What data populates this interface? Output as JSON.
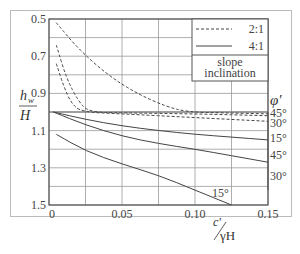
{
  "chart_data": {
    "type": "line",
    "title": "",
    "xlabel": "c'/γH",
    "ylabel": "h_w/H",
    "xlim": [
      0,
      0.15
    ],
    "ylim": [
      1.5,
      0.5
    ],
    "y_inverted": true,
    "grid": true,
    "x_ticks": [
      "0",
      "0.05",
      "0.10",
      "0.15"
    ],
    "y_ticks": [
      "0.5",
      "0.7",
      "0.9",
      "1.1",
      "1.3",
      "1.5"
    ],
    "legend": {
      "title": "slope inclination",
      "entries": [
        {
          "label": "2:1",
          "style": "dashed"
        },
        {
          "label": "4:1",
          "style": "solid"
        }
      ],
      "position": "upper right"
    },
    "phi_label": "φ'",
    "series": [
      {
        "name": "2:1, φ'=45°",
        "style": "dashed",
        "end_label": "45°",
        "x": [
          0.005,
          0.02,
          0.04,
          0.06,
          0.08,
          0.095,
          0.12,
          0.15
        ],
        "y": [
          0.52,
          0.66,
          0.8,
          0.9,
          0.97,
          1.0,
          1.005,
          1.01
        ]
      },
      {
        "name": "2:1, φ'=30°",
        "style": "dashed",
        "end_label": "30°",
        "x": [
          0.005,
          0.012,
          0.02,
          0.027,
          0.05,
          0.1,
          0.15
        ],
        "y": [
          0.64,
          0.82,
          0.94,
          1.0,
          1.005,
          1.01,
          1.02
        ]
      },
      {
        "name": "2:1, φ'=15°",
        "style": "dashed",
        "end_label": "15°",
        "x": [
          0.005,
          0.01,
          0.015,
          0.022,
          0.05,
          0.1,
          0.15
        ],
        "y": [
          0.74,
          0.86,
          0.95,
          1.0,
          1.01,
          1.03,
          1.05
        ]
      },
      {
        "name": "4:1, φ'=45°",
        "style": "solid",
        "end_label": "45°",
        "x": [
          0.003,
          0.025,
          0.05,
          0.075,
          0.1,
          0.125,
          0.15
        ],
        "y": [
          1.0,
          1.04,
          1.075,
          1.1,
          1.12,
          1.135,
          1.15
        ]
      },
      {
        "name": "4:1, φ'=30°",
        "style": "solid",
        "end_label": "30°",
        "x": [
          0.003,
          0.025,
          0.05,
          0.075,
          0.1,
          0.125,
          0.15
        ],
        "y": [
          1.0,
          1.07,
          1.13,
          1.17,
          1.2,
          1.235,
          1.27
        ]
      },
      {
        "name": "4:1, φ'=15°",
        "style": "solid",
        "end_label": "15°",
        "x": [
          0.005,
          0.025,
          0.05,
          0.075,
          0.1,
          0.125
        ],
        "y": [
          1.12,
          1.21,
          1.28,
          1.34,
          1.42,
          1.5
        ]
      }
    ]
  },
  "labels": {
    "ylabel_top": "h",
    "ylabel_sub": "w",
    "ylabel_bottom": "H",
    "xlabel_num": "c'",
    "xlabel_den": "γH",
    "phi": "φ'",
    "legend_title_1": "slope",
    "legend_title_2": "inclination",
    "legend_dashed": "2:1",
    "legend_solid": "4:1"
  }
}
